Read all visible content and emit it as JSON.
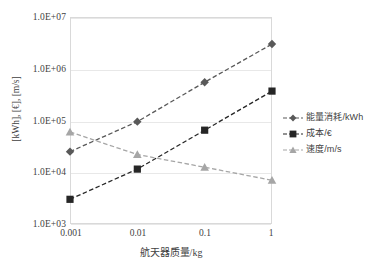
{
  "chart_data": {
    "type": "line",
    "title": "",
    "xlabel": "航天器质量/kg",
    "ylabel": "[kWh], [€], [m/s]",
    "xscale": "log",
    "yscale": "log",
    "x": [
      0.001,
      0.01,
      0.1,
      1
    ],
    "xtick_labels": [
      "0.001",
      "0.01",
      "0.1",
      "1"
    ],
    "ytick_labels": [
      "1.0E+03",
      "1.0E+04",
      "1.0E+05",
      "1.0E+06",
      "1.0E+07"
    ],
    "ytick_values": [
      1000,
      10000,
      100000,
      1000000,
      10000000
    ],
    "ylim": [
      1000,
      10000000
    ],
    "grid": "horizontal",
    "legend_position": "right",
    "series": [
      {
        "name": "能量消耗/kWh",
        "marker": "diamond",
        "color": "#595959",
        "linestyle": "dashed",
        "values": [
          25000,
          95000,
          550000,
          3000000
        ]
      },
      {
        "name": "成本/€",
        "marker": "square",
        "color": "#262626",
        "linestyle": "dashed",
        "values": [
          3000,
          11500,
          65000,
          370000
        ]
      },
      {
        "name": "速度/m/s",
        "marker": "triangle",
        "color": "#a6a6a6",
        "linestyle": "dashed",
        "values": [
          60000,
          22000,
          12500,
          7000
        ]
      }
    ]
  },
  "legend": {
    "items": [
      {
        "label": "能量消耗/kWh"
      },
      {
        "label": "成本/€"
      },
      {
        "label": "速度/m/s"
      }
    ]
  },
  "axes": {
    "y_title": "[kWh], [€], [m/s]",
    "x_title": "航天器质量/kg",
    "y_ticks": [
      "1.0E+07",
      "1.0E+06",
      "1.0E+05",
      "1.0E+04",
      "1.0E+03"
    ],
    "x_ticks": [
      "0.001",
      "0.01",
      "0.1",
      "1"
    ]
  }
}
